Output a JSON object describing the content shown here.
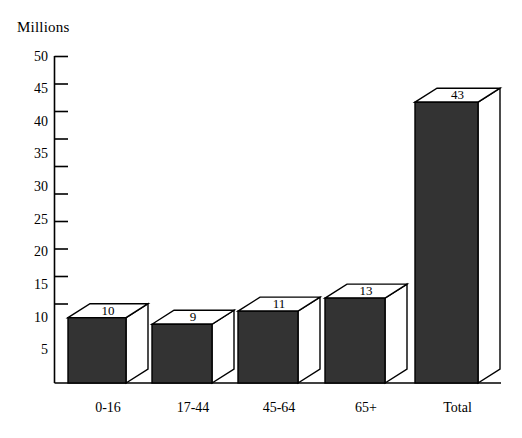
{
  "chart_data": {
    "type": "bar",
    "title": "",
    "subtitle": "",
    "unit_label": "Millions",
    "xlabel": "",
    "ylabel": "Millions",
    "categories": [
      "0-16",
      "17-44",
      "45-64",
      "65+",
      "Total"
    ],
    "values": [
      10,
      9,
      11,
      13,
      43
    ],
    "series": [
      {
        "name": "Population",
        "values": [
          10,
          9,
          11,
          13,
          43
        ]
      }
    ],
    "data_labels": [
      "10",
      "9",
      "11",
      "13",
      "43"
    ],
    "ylim": [
      0,
      50
    ],
    "ytick_values": [
      5,
      10,
      15,
      20,
      25,
      30,
      35,
      40,
      45,
      50
    ],
    "ytick_labels": [
      "5",
      "10",
      "15",
      "20",
      "25",
      "30",
      "35",
      "40",
      "45",
      "50"
    ],
    "grid": false,
    "legend": false,
    "legend_position": "none",
    "style": "3d-bar",
    "bar_fill_color": "#333333",
    "bar_edge_color": "#000000",
    "bar_top_face_color": "#ffffff",
    "bar_side_face_color": "#ffffff",
    "axis_color": "#000000",
    "background_color": "#ffffff",
    "text_color": "#000000"
  },
  "axis": {
    "unit_label": "Millions"
  }
}
